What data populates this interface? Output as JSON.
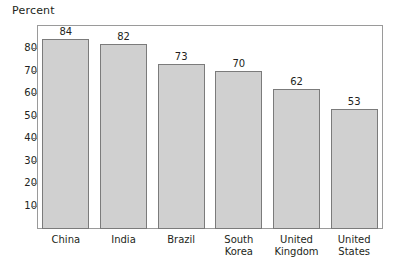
{
  "chart_data": {
    "type": "bar",
    "title": "",
    "xlabel": "",
    "ylabel": "Percent",
    "ylim": [
      0,
      90
    ],
    "yticks": [
      10,
      20,
      30,
      40,
      50,
      60,
      70,
      80
    ],
    "ytick_labels": [
      "10",
      "20",
      "30",
      "40",
      "50",
      "60",
      "70",
      "80"
    ],
    "grid": false,
    "legend": "none",
    "categories": [
      "China",
      "India",
      "Brazil",
      "South Korea",
      "United Kingdom",
      "United States"
    ],
    "category_lines": [
      [
        "China"
      ],
      [
        "India"
      ],
      [
        "Brazil"
      ],
      [
        "South",
        "Korea"
      ],
      [
        "United",
        "Kingdom"
      ],
      [
        "United",
        "States"
      ]
    ],
    "values": [
      84,
      82,
      73,
      70,
      62,
      53
    ],
    "value_labels": [
      "84",
      "82",
      "73",
      "70",
      "62",
      "53"
    ],
    "bar_fill_color": "#d0d0d0",
    "bar_edge_color": "#7b7b7b",
    "frame_color": "#9a9a9a",
    "text_color": "#231f20",
    "background_color": "#ffffff"
  }
}
